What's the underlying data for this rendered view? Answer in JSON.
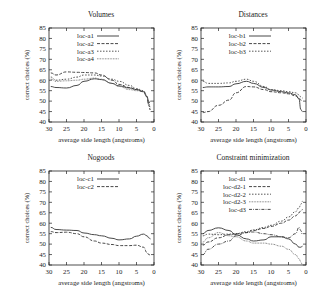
{
  "figure": {
    "common": {
      "xlabel": "average side length (angstroms)",
      "ylabel": "correct choices (%)",
      "xticks": [
        30,
        25,
        20,
        15,
        10,
        5,
        0
      ],
      "yticks": [
        40,
        45,
        50,
        55,
        60,
        65,
        70,
        75,
        80,
        85
      ]
    }
  },
  "chart_data": [
    {
      "type": "line",
      "title": "Volumes",
      "xlabel": "average side length (angstroms)",
      "ylabel": "correct choices (%)",
      "xlim": [
        30,
        0
      ],
      "ylim": [
        40,
        85
      ],
      "legend_position": "upper-left",
      "x": [
        29.5,
        28,
        25,
        22,
        20,
        17,
        15,
        12,
        10,
        7,
        5,
        3,
        2,
        1.5,
        1
      ],
      "series": [
        {
          "name": "loc-a1",
          "style": "solid",
          "values": [
            57,
            56.5,
            56.3,
            57.5,
            59.5,
            60.7,
            60.3,
            58.5,
            57.3,
            56.3,
            55.5,
            54.5,
            52,
            49,
            50
          ]
        },
        {
          "name": "loc-a2",
          "style": "dashed",
          "values": [
            63.5,
            62.5,
            64,
            63.8,
            63.7,
            63.5,
            62.5,
            60,
            58,
            56.5,
            55.5,
            54.5,
            52,
            48,
            46
          ]
        },
        {
          "name": "loc-a3",
          "style": "dotted",
          "values": [
            61.5,
            60,
            60.5,
            61.5,
            62.5,
            62.5,
            62,
            60.5,
            59.5,
            57.5,
            56,
            55,
            52.5,
            48,
            45
          ]
        },
        {
          "name": "loc-a4",
          "style": "dotted-fine",
          "values": [
            60.5,
            59.5,
            59.7,
            60,
            60.5,
            61,
            60.5,
            58.5,
            57,
            55.5,
            55,
            54.5,
            52,
            49,
            47
          ]
        }
      ]
    },
    {
      "type": "line",
      "title": "Distances",
      "xlabel": "average side length (angstroms)",
      "ylabel": "correct choices (%)",
      "xlim": [
        30,
        0
      ],
      "ylim": [
        40,
        85
      ],
      "legend_position": "upper-left",
      "x": [
        29.5,
        28,
        25,
        22,
        20,
        17,
        15,
        12,
        10,
        7,
        5,
        3,
        2,
        1.5,
        1
      ],
      "series": [
        {
          "name": "loc-b1",
          "style": "solid",
          "values": [
            56.5,
            56.8,
            56.8,
            57,
            58.3,
            59.5,
            58.5,
            56.5,
            55.3,
            54.5,
            54,
            53,
            51,
            46,
            45
          ]
        },
        {
          "name": "loc-b2",
          "style": "dashed",
          "values": [
            44.5,
            45,
            48,
            50.5,
            54,
            57,
            56.8,
            55.5,
            54.5,
            54,
            53.5,
            52.5,
            51.5,
            50.5,
            50
          ]
        },
        {
          "name": "loc-b3",
          "style": "dotted",
          "values": [
            59.5,
            58.5,
            58.5,
            58.7,
            59.5,
            60.5,
            59.5,
            57,
            55.5,
            55,
            54.5,
            54,
            53,
            52,
            51.5
          ]
        }
      ]
    },
    {
      "type": "line",
      "title": "Nogoods",
      "xlabel": "average side length (angstroms)",
      "ylabel": "correct choices (%)",
      "xlim": [
        30,
        0
      ],
      "ylim": [
        40,
        85
      ],
      "legend_position": "upper-left",
      "x": [
        29.5,
        28,
        25,
        22,
        20,
        17,
        15,
        12,
        10,
        7,
        5,
        3,
        2,
        1.5,
        1
      ],
      "series": [
        {
          "name": "loc-c1",
          "style": "solid",
          "values": [
            58,
            57,
            56.7,
            56.5,
            55.3,
            54.5,
            54,
            52.8,
            52,
            52.5,
            53.8,
            54.8,
            54,
            53,
            52.5
          ]
        },
        {
          "name": "loc-c2",
          "style": "dashed",
          "values": [
            56,
            55.5,
            55.7,
            55,
            53.5,
            51.5,
            50.5,
            49.8,
            49.3,
            49.3,
            49.5,
            48.5,
            46,
            45,
            44.8
          ]
        }
      ]
    },
    {
      "type": "line",
      "title": "Constraint minimization",
      "xlabel": "average side length (angstroms)",
      "ylabel": "correct choices (%)",
      "xlim": [
        30,
        0
      ],
      "ylim": [
        40,
        85
      ],
      "legend_position": "upper-left",
      "x": [
        29.5,
        28,
        25,
        22,
        20,
        17,
        15,
        12,
        10,
        7,
        5,
        3,
        2,
        1.5,
        1
      ],
      "series": [
        {
          "name": "loc-d1",
          "style": "solid",
          "values": [
            55,
            56.5,
            57.8,
            56.5,
            54.5,
            52.5,
            51.5,
            52,
            53.5,
            53.5,
            52.5,
            50,
            48.5,
            48.5,
            49
          ]
        },
        {
          "name": "loc-d2-1",
          "style": "dashed",
          "values": [
            49.5,
            51,
            53,
            54.5,
            55,
            55.5,
            56.5,
            57.5,
            58.5,
            60,
            61.5,
            63.5,
            65,
            66,
            66.5
          ]
        },
        {
          "name": "loc-d2-2",
          "style": "dotted",
          "values": [
            54,
            54.8,
            54.5,
            54.8,
            55,
            56,
            56.8,
            58,
            59,
            61,
            63,
            65.5,
            67.5,
            69,
            70.5
          ]
        },
        {
          "name": "loc-d2-3",
          "style": "dotted-fine",
          "values": [
            51,
            53,
            55.5,
            54,
            53.5,
            51.5,
            50.5,
            50.5,
            50,
            49,
            47.5,
            45,
            43,
            41.5,
            40
          ]
        },
        {
          "name": "loc-d3",
          "style": "dashdot",
          "values": [
            45,
            47.5,
            50,
            51.5,
            54,
            55.5,
            55.8,
            55,
            54.5,
            53.5,
            53,
            55,
            58,
            56.5,
            54.5
          ]
        }
      ]
    }
  ]
}
